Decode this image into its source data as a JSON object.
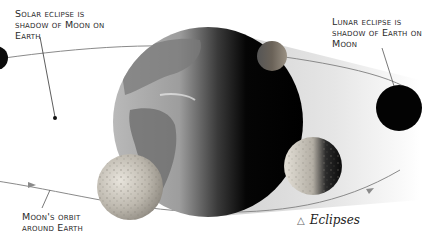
{
  "labels": {
    "solar": [
      "Solar eclipse is",
      "shadow of Moon on",
      "Earth"
    ],
    "lunar": [
      "Lunar eclipse is",
      "shadow of Earth on",
      "Moon"
    ],
    "orbit": [
      "Moon's orbit",
      "around Earth"
    ]
  },
  "caption": {
    "icon": "triangle-icon",
    "symbol": "△",
    "title": "Eclipses"
  },
  "colors": {
    "background": "#ffffff",
    "shadow_band": "#d8d8d8",
    "orbit_line": "#8a8a8a",
    "earth_dark": "#050505",
    "ocean": "#9a9a9a",
    "land": "#6e6e6e",
    "moon_light": "#d9d4cc",
    "moon_shadow": "#1a1a1a"
  }
}
